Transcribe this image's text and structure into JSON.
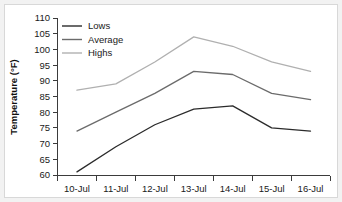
{
  "chart_data": {
    "type": "line",
    "title": "",
    "xlabel": "",
    "ylabel": "Temperature (°F)",
    "categories": [
      "10-Jul",
      "11-Jul",
      "12-Jul",
      "13-Jul",
      "14-Jul",
      "15-Jul",
      "16-Jul"
    ],
    "ylim": [
      60,
      110
    ],
    "ytick_step": 5,
    "yticks": [
      110,
      105,
      100,
      95,
      90,
      85,
      80,
      75,
      70,
      65,
      60
    ],
    "ytick_labels": [
      "110",
      "105",
      "100",
      "95",
      "90",
      "85",
      "80",
      "75",
      "70",
      "65",
      "60"
    ],
    "grid": false,
    "legend_position": "top-left-inside",
    "series": [
      {
        "name": "Lows",
        "color": "#2b2b2b",
        "values": [
          61,
          69,
          76,
          81,
          82,
          75,
          74
        ]
      },
      {
        "name": "Average",
        "color": "#6b6b6b",
        "values": [
          74,
          80,
          86,
          93,
          92,
          86,
          84
        ]
      },
      {
        "name": "Highs",
        "color": "#b0b0b0",
        "values": [
          87,
          89,
          96,
          104,
          101,
          96,
          93
        ]
      }
    ]
  },
  "legend": {
    "items": [
      {
        "label": "Lows"
      },
      {
        "label": "Average"
      },
      {
        "label": "Highs"
      }
    ]
  },
  "axes": {
    "y_title": "Temperature (°F)"
  },
  "colors": {
    "page_background": "#f2f2f2",
    "plot_background": "#ffffff",
    "axis": "#3b3b3b",
    "text": "#1a1a1a",
    "lows": "#2b2b2b",
    "average": "#6b6b6b",
    "highs": "#b0b0b0"
  }
}
